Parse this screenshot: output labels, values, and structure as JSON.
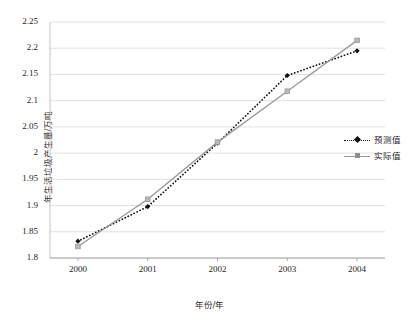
{
  "chart_data": {
    "type": "line",
    "title": "",
    "xlabel": "年份/年",
    "ylabel": "年生活垃圾产生量/万吨",
    "categories": [
      "2000",
      "2001",
      "2002",
      "2003",
      "2004"
    ],
    "x": [
      2000,
      2001,
      2002,
      2003,
      2004
    ],
    "xlim": [
      1999.6,
      2004.4
    ],
    "ylim": [
      1.8,
      2.25
    ],
    "ytick_labels": [
      "1.8",
      "1.85",
      "1.9",
      "1.95",
      "2",
      "2.05",
      "2.1",
      "2.15",
      "2.2",
      "2.25"
    ],
    "ytick_values": [
      1.8,
      1.85,
      1.9,
      1.95,
      2.0,
      2.05,
      2.1,
      2.15,
      2.2,
      2.25
    ],
    "xtick_labels": [
      "2000",
      "2001",
      "2002",
      "2003",
      "2004"
    ],
    "grid": "horizontal",
    "legend_position": "right-middle",
    "series": [
      {
        "name": "预测值",
        "values": [
          1.832,
          1.898,
          2.019,
          2.148,
          2.195
        ],
        "line_style": "dotted",
        "color": "#111111",
        "marker": "diamond"
      },
      {
        "name": "实际值",
        "values": [
          1.822,
          1.912,
          2.021,
          2.118,
          2.215
        ],
        "line_style": "solid",
        "color": "#9a9a9a",
        "marker": "square"
      }
    ]
  },
  "legend": {
    "items": [
      {
        "label": "预测值",
        "style": "dotted",
        "marker": "diamond"
      },
      {
        "label": "实际值",
        "style": "solid",
        "marker": "square"
      }
    ]
  },
  "colors": {
    "predicted": "#111111",
    "actual": "#9a9a9a",
    "grid": "#d9d9d9",
    "axis": "#bdbdbd",
    "background": "#ffffff"
  }
}
